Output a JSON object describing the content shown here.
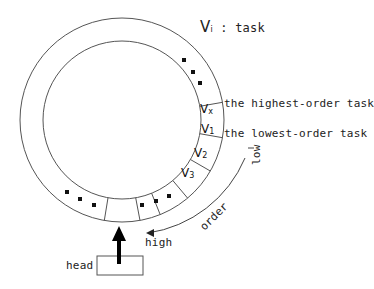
{
  "legend": {
    "symbol": "V",
    "subscript": "i",
    "text": " : task"
  },
  "segments": [
    {
      "symbol": "V",
      "sub": "x"
    },
    {
      "symbol": "V",
      "sub": "1"
    },
    {
      "symbol": "V",
      "sub": "2"
    },
    {
      "symbol": "V",
      "sub": "3"
    }
  ],
  "annotations": {
    "highest": "the highest-order task",
    "lowest": "the lowest-order task",
    "low": "low",
    "order": "order",
    "high": "high",
    "head": "head"
  }
}
